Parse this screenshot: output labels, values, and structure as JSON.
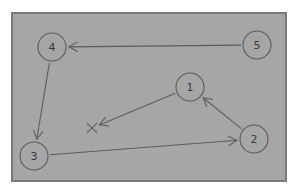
{
  "diagram": {
    "background_color": "#a6a6a6",
    "ink_color": "#5a5a5a",
    "nodes": [
      {
        "id": "1",
        "label": "1"
      },
      {
        "id": "2",
        "label": "2"
      },
      {
        "id": "3",
        "label": "3"
      },
      {
        "id": "4",
        "label": "4"
      },
      {
        "id": "5",
        "label": "5"
      }
    ],
    "edges": [
      {
        "from": "5",
        "to": "4"
      },
      {
        "from": "4",
        "to": "3"
      },
      {
        "from": "3",
        "to": "2"
      },
      {
        "from": "2",
        "to": "1"
      },
      {
        "from": "1",
        "to": "X"
      }
    ],
    "marks": [
      {
        "id": "X",
        "symbol": "×"
      }
    ]
  }
}
